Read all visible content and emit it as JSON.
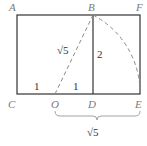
{
  "diagram": {
    "points": {
      "A": {
        "label": "A",
        "x": 17,
        "y": 15
      },
      "B": {
        "label": "B",
        "x": 93,
        "y": 15
      },
      "F": {
        "label": "F",
        "x": 140,
        "y": 15
      },
      "C": {
        "label": "C",
        "x": 17,
        "y": 94
      },
      "O": {
        "label": "O",
        "x": 55,
        "y": 94
      },
      "D": {
        "label": "D",
        "x": 93,
        "y": 94
      },
      "E": {
        "label": "E",
        "x": 140,
        "y": 94
      }
    },
    "segment_labels": {
      "CO": "1",
      "OD": "1",
      "OB": "√5",
      "BD": "2",
      "OE": "√5"
    },
    "colors": {
      "solid_line": "#333333",
      "dashed_line": "#8a8a8a",
      "point_label": "#7a7a7a",
      "number_label": "#333333"
    }
  }
}
